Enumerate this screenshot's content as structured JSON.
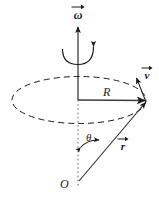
{
  "figure": {
    "background_color": "#ffffff",
    "stroke_color": "#1a1a1a",
    "width": 159,
    "height": 202,
    "labels": {
      "omega": "ω",
      "velocity": "v",
      "radius": "R",
      "position": "r",
      "angle": "θ",
      "origin": "O"
    },
    "elements": {
      "axis_name": "rotation-axis",
      "circle_name": "rotation-circle",
      "spin_arrow_name": "spin-direction-arc",
      "radius_vector_name": "radius-vector",
      "position_vector_name": "position-vector",
      "velocity_vector_name": "velocity-vector",
      "angle_arc_name": "polar-angle-arc"
    },
    "geometry": {
      "origin_x": 78,
      "origin_y": 182,
      "center_x": 78,
      "center_y": 100,
      "point_x": 147,
      "point_y": 101,
      "ellipse_rx": 68,
      "ellipse_ry": 24
    }
  }
}
